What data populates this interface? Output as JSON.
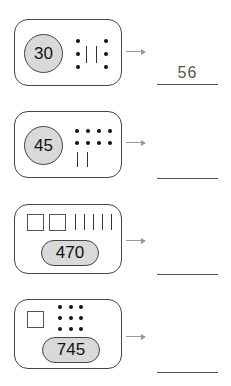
{
  "problems": [
    {
      "number_label": "30",
      "representation": {
        "dots": 6,
        "sticks": 2,
        "squares": 0
      },
      "answer": "56"
    },
    {
      "number_label": "45",
      "representation": {
        "dots": 8,
        "sticks": 2,
        "squares": 0
      },
      "answer": ""
    },
    {
      "number_label": "470",
      "representation": {
        "dots": 0,
        "sticks": 5,
        "squares": 2
      },
      "answer": ""
    },
    {
      "number_label": "745",
      "representation": {
        "dots": 9,
        "sticks": 0,
        "squares": 1
      },
      "answer": ""
    }
  ],
  "icons": {
    "arrow": "right-arrow-icon"
  }
}
